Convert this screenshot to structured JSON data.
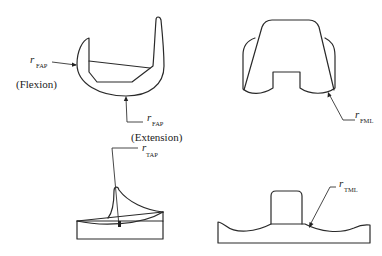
{
  "diagram": {
    "panels": [
      {
        "id": "femoral-sagittal",
        "labels": [
          {
            "symbol": "r",
            "subscript": "FAP",
            "caption": "(Flexion)"
          },
          {
            "symbol": "r",
            "subscript": "FAP",
            "caption": "(Extension)"
          }
        ]
      },
      {
        "id": "femoral-coronal",
        "labels": [
          {
            "symbol": "r",
            "subscript": "FML"
          }
        ]
      },
      {
        "id": "tibial-sagittal",
        "labels": [
          {
            "symbol": "r",
            "subscript": "TAP"
          }
        ]
      },
      {
        "id": "tibial-coronal",
        "labels": [
          {
            "symbol": "r",
            "subscript": "TML"
          }
        ]
      }
    ]
  }
}
